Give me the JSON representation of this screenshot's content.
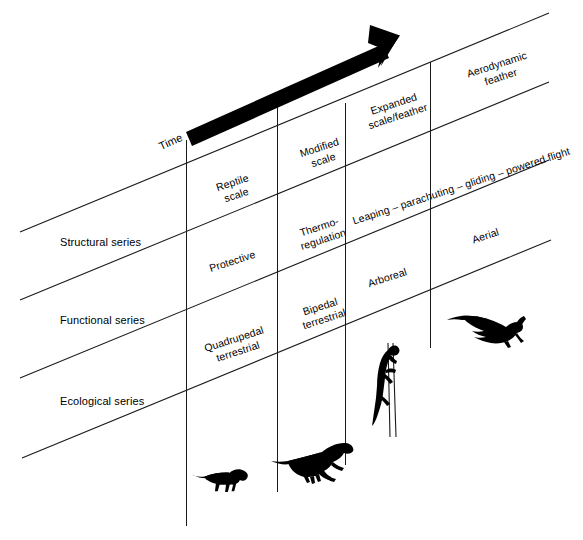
{
  "figure": {
    "time_axis_label": "Time",
    "background_color": "#ffffff",
    "line_color": "#1a1a1a",
    "silhouette_color": "#000000"
  },
  "row_labels": [
    {
      "id": "structural",
      "text": "Structural series"
    },
    {
      "id": "functional",
      "text": "Functional series"
    },
    {
      "id": "ecological",
      "text": "Ecological series"
    }
  ],
  "structural_series": [
    {
      "col": 1,
      "text": "Reptile\nscale"
    },
    {
      "col": 2,
      "text": "Modified\nscale"
    },
    {
      "col": 3,
      "text": "Expanded\nscale/feather"
    },
    {
      "col": 4,
      "text": "Aerodynamic\nfeather"
    }
  ],
  "functional_series": [
    {
      "col": 1,
      "text": "Protective"
    },
    {
      "col": 2,
      "text": "Thermo-\nregulation"
    },
    {
      "col": 3,
      "text": "Leaping – parachuting – gliding – powered flight"
    },
    {
      "col": 4,
      "text": ""
    }
  ],
  "ecological_series": [
    {
      "col": 1,
      "text": "Quadrupedal\nterrestrial"
    },
    {
      "col": 2,
      "text": "Bipedal\nterrestrial"
    },
    {
      "col": 3,
      "text": "Arboreal"
    },
    {
      "col": 4,
      "text": "Aerial"
    }
  ],
  "silhouettes": [
    {
      "id": "quadrupedal-dinosaur",
      "name": "quadrupedal-dinosaur-silhouette",
      "col": 1
    },
    {
      "id": "bipedal-dinosaur",
      "name": "bipedal-dinosaur-silhouette",
      "col": 2
    },
    {
      "id": "climbing-dinosaur",
      "name": "climbing-arboreal-dinosaur-silhouette",
      "col": 3
    },
    {
      "id": "flying-bird",
      "name": "flying-bird-silhouette",
      "col": 4
    }
  ]
}
